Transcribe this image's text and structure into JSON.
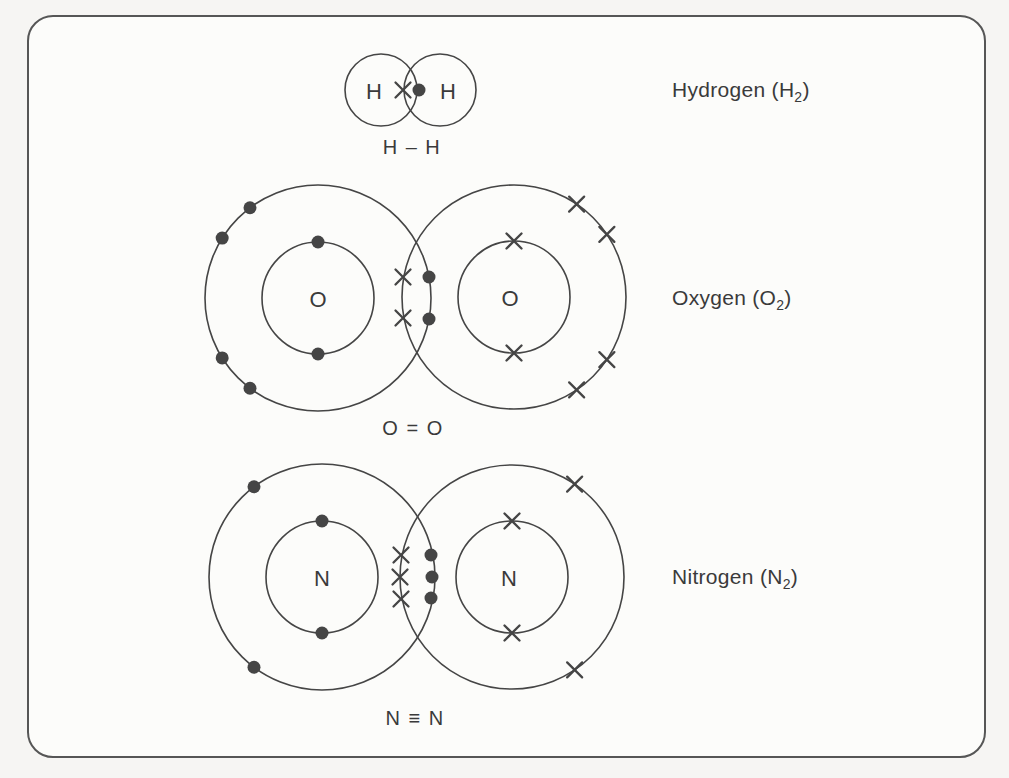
{
  "page": {
    "background": "#f6f5f3"
  },
  "frame": {
    "fill": "#fcfcfa",
    "stroke": "#565656"
  },
  "diagram": {
    "ink": "#454545",
    "text_color": "#3a3a3a",
    "molecules": [
      {
        "name": "hydrogen",
        "caption": {
          "prefix": "Hydrogen (H",
          "subscript": "2",
          "suffix": ")"
        },
        "caption_pos": {
          "x": 672,
          "y": 90
        },
        "bond_label": "H – H",
        "bond_label_pos": {
          "x": 412,
          "y": 147
        },
        "bond_type": "single",
        "atoms": [
          {
            "symbol": "H",
            "cx": 381,
            "cy": 90,
            "label_dx": -7,
            "shells": [
              {
                "r": 36,
                "electrons": []
              }
            ]
          },
          {
            "symbol": "H",
            "cx": 440,
            "cy": 90,
            "label_dx": 8,
            "shells": [
              {
                "r": 36,
                "electrons": []
              }
            ]
          }
        ],
        "shared_electrons": [
          {
            "type": "cross",
            "x": 403,
            "y": 90
          },
          {
            "type": "dot",
            "x": 419,
            "y": 90
          }
        ]
      },
      {
        "name": "oxygen",
        "caption": {
          "prefix": "Oxygen (O",
          "subscript": "2",
          "suffix": ")"
        },
        "caption_pos": {
          "x": 672,
          "y": 298
        },
        "bond_label": "O = O",
        "bond_label_pos": {
          "x": 413,
          "y": 428
        },
        "bond_type": "double",
        "atoms": [
          {
            "symbol": "O",
            "cx": 318,
            "cy": 298,
            "label_dx": 0,
            "shells": [
              {
                "r": 56,
                "electrons": [
                  {
                    "type": "dot",
                    "angle": 90
                  },
                  {
                    "type": "dot",
                    "angle": 270
                  }
                ]
              },
              {
                "r": 113,
                "electrons": [
                  {
                    "type": "dot",
                    "angle": 127
                  },
                  {
                    "type": "dot",
                    "angle": 148
                  },
                  {
                    "type": "dot",
                    "angle": 212
                  },
                  {
                    "type": "dot",
                    "angle": 233
                  }
                ]
              }
            ]
          },
          {
            "symbol": "O",
            "cx": 514,
            "cy": 297,
            "label_dx": -4,
            "shells": [
              {
                "r": 56,
                "electrons": [
                  {
                    "type": "cross",
                    "angle": 90
                  },
                  {
                    "type": "cross",
                    "angle": 270
                  }
                ]
              },
              {
                "r": 112,
                "electrons": [
                  {
                    "type": "cross",
                    "angle": 56
                  },
                  {
                    "type": "cross",
                    "angle": 34
                  },
                  {
                    "type": "cross",
                    "angle": 326
                  },
                  {
                    "type": "cross",
                    "angle": 304
                  }
                ]
              }
            ]
          }
        ],
        "shared_electrons": [
          {
            "type": "cross",
            "x": 403,
            "y": 277
          },
          {
            "type": "cross",
            "x": 403,
            "y": 318
          },
          {
            "type": "dot",
            "x": 429,
            "y": 277
          },
          {
            "type": "dot",
            "x": 429,
            "y": 319
          }
        ]
      },
      {
        "name": "nitrogen",
        "caption": {
          "prefix": "Nitrogen (N",
          "subscript": "2",
          "suffix": ")"
        },
        "caption_pos": {
          "x": 672,
          "y": 577
        },
        "bond_label": "N ≡ N",
        "bond_label_pos": {
          "x": 415,
          "y": 718
        },
        "bond_type": "triple",
        "atoms": [
          {
            "symbol": "N",
            "cx": 322,
            "cy": 577,
            "label_dx": 0,
            "shells": [
              {
                "r": 56,
                "electrons": [
                  {
                    "type": "dot",
                    "angle": 90
                  },
                  {
                    "type": "dot",
                    "angle": 270
                  }
                ]
              },
              {
                "r": 113,
                "electrons": [
                  {
                    "type": "dot",
                    "angle": 127
                  },
                  {
                    "type": "dot",
                    "angle": 233
                  }
                ]
              }
            ]
          },
          {
            "symbol": "N",
            "cx": 512,
            "cy": 577,
            "label_dx": -3,
            "shells": [
              {
                "r": 56,
                "electrons": [
                  {
                    "type": "cross",
                    "angle": 90
                  },
                  {
                    "type": "cross",
                    "angle": 270
                  }
                ]
              },
              {
                "r": 112,
                "electrons": [
                  {
                    "type": "cross",
                    "angle": 56
                  },
                  {
                    "type": "cross",
                    "angle": 304
                  }
                ]
              }
            ]
          }
        ],
        "shared_electrons": [
          {
            "type": "cross",
            "x": 401,
            "y": 555
          },
          {
            "type": "cross",
            "x": 400,
            "y": 577
          },
          {
            "type": "cross",
            "x": 401,
            "y": 599
          },
          {
            "type": "dot",
            "x": 431,
            "y": 555
          },
          {
            "type": "dot",
            "x": 432,
            "y": 577
          },
          {
            "type": "dot",
            "x": 431,
            "y": 598
          }
        ]
      }
    ]
  }
}
